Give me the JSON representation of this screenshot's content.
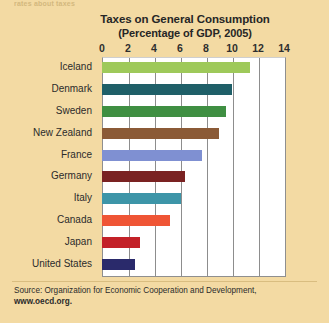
{
  "page": {
    "background_color": "#f3daa3",
    "top_cut_off_fragment": "rates about taxes"
  },
  "figure": {
    "title": "Taxes on General Consumption",
    "subtitle": "(Percentage of GDP, 2005)",
    "source_prefix": "Source: Organization for Economic Cooperation and Development,",
    "source_url": "www.oecd.org."
  },
  "chart_data": {
    "type": "bar",
    "orientation": "horizontal",
    "title": "Taxes on General Consumption",
    "subtitle": "(Percentage of GDP, 2005)",
    "xlabel": "",
    "ylabel": "",
    "xlim": [
      0,
      14
    ],
    "xticks": [
      0,
      2,
      4,
      6,
      8,
      10,
      12,
      14
    ],
    "xtick_labels": [
      "0",
      "2",
      "4",
      "6",
      "8",
      "10",
      "12",
      "14"
    ],
    "grid": "vertical",
    "legend": "none",
    "plot_background": "#ffffff",
    "categories": [
      "Iceland",
      "Denmark",
      "Sweden",
      "New Zealand",
      "France",
      "Germany",
      "Italy",
      "Canada",
      "Japan",
      "United States"
    ],
    "values": [
      11.4,
      10.0,
      9.5,
      9.0,
      7.7,
      6.4,
      6.1,
      5.2,
      2.9,
      2.5
    ],
    "bar_colors": [
      "#9ec95a",
      "#1f5f68",
      "#3f8f42",
      "#8b5a36",
      "#7f90d2",
      "#7a2222",
      "#3d95a8",
      "#ef5535",
      "#c32128",
      "#2a2a6b"
    ]
  }
}
